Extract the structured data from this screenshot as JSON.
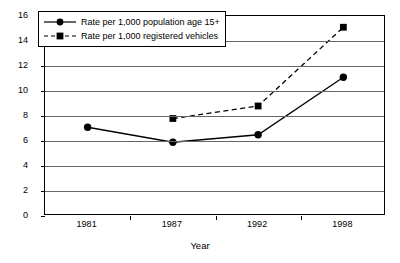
{
  "chart_data": {
    "type": "line",
    "title": "",
    "subtitle": "",
    "xlabel": "Year",
    "ylabel": "Rate",
    "categories": [
      "1981",
      "1987",
      "1992",
      "1998"
    ],
    "ylim": [
      0,
      16
    ],
    "ytick_step": 2,
    "yticks": [
      "16",
      "14",
      "12",
      "10",
      "8",
      "6",
      "4",
      "2",
      "0"
    ],
    "grid": "horizontal",
    "legend_position": "inside-top-left",
    "series": [
      {
        "name": "Rate per 1,000 population age 15+",
        "marker": "circle",
        "line": "solid",
        "color": "#000000",
        "values": [
          7.1,
          5.9,
          6.5,
          11.1
        ]
      },
      {
        "name": "Rate per 1,000 registered vehicles",
        "marker": "square",
        "line": "dashed",
        "color": "#000000",
        "values": [
          null,
          7.8,
          8.8,
          15.1
        ]
      }
    ]
  },
  "legend": {
    "entries": [
      {
        "label": "Rate per 1,000 population age 15+"
      },
      {
        "label": "Rate per 1,000 registered vehicles"
      }
    ]
  },
  "axes": {
    "y_title": "Rate",
    "x_title": "Year"
  },
  "colors": {
    "ink": "#000000",
    "grid": "#666666",
    "background": "#ffffff"
  }
}
